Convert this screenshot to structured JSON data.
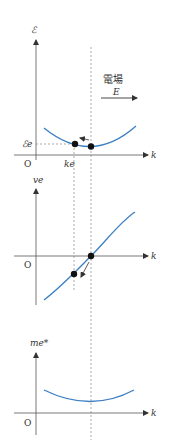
{
  "colors": {
    "curve": "#3a7fc4",
    "axis": "#555555",
    "dashed": "#888888",
    "dot": "#111111",
    "text": "#333333"
  },
  "field": {
    "label_jp": "電場",
    "symbol": "E"
  },
  "graphs": [
    {
      "id": "energy",
      "y_label": "ℰ",
      "x_label": "k",
      "origin_label": "O",
      "level_label": "ℰe",
      "k_label": "ke"
    },
    {
      "id": "velocity",
      "y_label": "ve",
      "x_label": "k",
      "origin_label": "O"
    },
    {
      "id": "effective-mass",
      "y_label": "me*",
      "x_label": "k",
      "origin_label": "O"
    }
  ]
}
